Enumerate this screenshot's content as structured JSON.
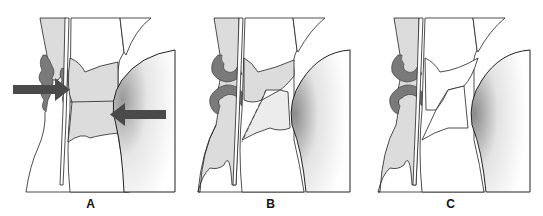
{
  "figure": {
    "panels": [
      {
        "id": "A",
        "label": "A",
        "arrows": 2,
        "dashed_line": false,
        "shaded_gap": true
      },
      {
        "id": "B",
        "label": "B",
        "arrows": 0,
        "dashed_line": true,
        "shaded_gap": true
      },
      {
        "id": "C",
        "label": "C",
        "arrows": 0,
        "dashed_line": false,
        "shaded_gap": false
      }
    ],
    "colors": {
      "outline": "#222222",
      "light_fill": "#dcdcdc",
      "dark_fill": "#7a7a7a",
      "arrow": "#4a4a4a",
      "background": "#ffffff"
    }
  }
}
